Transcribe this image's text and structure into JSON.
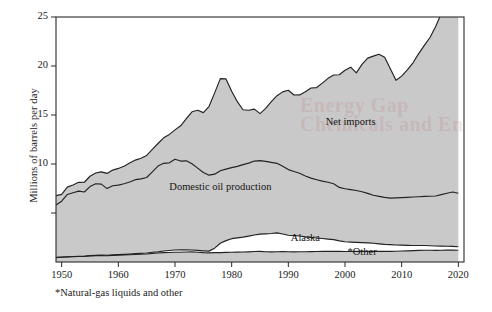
{
  "figure": {
    "footnote": "*Natural-gas liquids and other",
    "watermark_line1": "Energy Gap",
    "watermark_line2": "Chemicals and En"
  },
  "chart_data": {
    "type": "area",
    "stacked": true,
    "title": "",
    "xlabel": "",
    "ylabel": "Millions of barrels per day",
    "xlim": [
      1949,
      2021
    ],
    "ylim": [
      0,
      25
    ],
    "grid": false,
    "legend": "inline-labels",
    "x_ticks": [
      1950,
      1960,
      1970,
      1980,
      1990,
      2000,
      2010,
      2020
    ],
    "x_tick_labels": [
      "1950",
      "1960",
      "1970",
      "1980",
      "1990",
      "2000",
      "2010",
      "2020"
    ],
    "y_ticks": [
      5,
      10,
      15,
      20,
      25
    ],
    "y_tick_labels": [
      "",
      "10",
      "15",
      "20",
      "25"
    ],
    "annotations": [
      {
        "text": "Net imports",
        "x": 2001,
        "y": 14.2
      },
      {
        "text": "Domestic oil production",
        "x": 1978,
        "y": 7.6
      },
      {
        "text": "Alaska",
        "x": 1993,
        "y": 2.35
      },
      {
        "text": "*Other",
        "x": 2003,
        "y": 0.95
      }
    ],
    "x": [
      1949,
      1950,
      1951,
      1952,
      1953,
      1954,
      1955,
      1956,
      1957,
      1958,
      1959,
      1960,
      1961,
      1962,
      1963,
      1964,
      1965,
      1966,
      1967,
      1968,
      1969,
      1970,
      1971,
      1972,
      1973,
      1974,
      1975,
      1976,
      1977,
      1978,
      1979,
      1980,
      1981,
      1982,
      1983,
      1984,
      1985,
      1986,
      1987,
      1988,
      1989,
      1990,
      1991,
      1992,
      1993,
      1994,
      1995,
      1996,
      1997,
      1998,
      1999,
      2000,
      2001,
      2002,
      2003,
      2004,
      2005,
      2006,
      2007,
      2008,
      2009,
      2010,
      2011,
      2012,
      2013,
      2014,
      2015,
      2016,
      2017,
      2018,
      2019,
      2020
    ],
    "series": [
      {
        "name": "*Other",
        "key": "other",
        "fill": "#c9c9c9",
        "values": [
          0.45,
          0.48,
          0.52,
          0.54,
          0.56,
          0.57,
          0.62,
          0.65,
          0.66,
          0.64,
          0.68,
          0.7,
          0.72,
          0.74,
          0.77,
          0.79,
          0.82,
          0.88,
          0.92,
          0.95,
          0.97,
          1.0,
          1.0,
          1.02,
          1.03,
          0.99,
          0.95,
          0.93,
          0.95,
          0.96,
          0.98,
          1.0,
          1.01,
          1.02,
          1.04,
          1.07,
          1.08,
          1.05,
          1.03,
          1.05,
          1.06,
          1.05,
          1.04,
          1.05,
          1.05,
          1.06,
          1.07,
          1.08,
          1.09,
          1.1,
          1.08,
          1.07,
          1.07,
          1.08,
          1.09,
          1.1,
          1.09,
          1.08,
          1.08,
          1.09,
          1.1,
          1.12,
          1.14,
          1.16,
          1.18,
          1.2,
          1.2,
          1.19,
          1.2,
          1.21,
          1.21,
          1.2
        ]
      },
      {
        "name": "Alaska",
        "key": "alaska",
        "fill": "#ffffff",
        "values": [
          0.02,
          0.02,
          0.02,
          0.02,
          0.02,
          0.02,
          0.03,
          0.03,
          0.04,
          0.05,
          0.05,
          0.05,
          0.06,
          0.07,
          0.08,
          0.09,
          0.1,
          0.11,
          0.12,
          0.17,
          0.2,
          0.23,
          0.24,
          0.22,
          0.2,
          0.19,
          0.19,
          0.18,
          0.46,
          0.95,
          1.2,
          1.38,
          1.45,
          1.52,
          1.6,
          1.68,
          1.76,
          1.82,
          1.88,
          1.92,
          1.8,
          1.68,
          1.65,
          1.6,
          1.52,
          1.45,
          1.38,
          1.32,
          1.25,
          1.18,
          1.08,
          1.0,
          0.96,
          0.92,
          0.88,
          0.85,
          0.82,
          0.77,
          0.72,
          0.68,
          0.64,
          0.6,
          0.56,
          0.52,
          0.5,
          0.48,
          0.46,
          0.44,
          0.42,
          0.4,
          0.38,
          0.36
        ]
      },
      {
        "name": "Domestic oil production",
        "key": "lower48",
        "fill": "#c9c9c9",
        "values": [
          5.35,
          5.7,
          6.35,
          6.5,
          6.65,
          6.55,
          7.05,
          7.3,
          7.25,
          6.8,
          7.05,
          7.1,
          7.2,
          7.35,
          7.55,
          7.6,
          7.7,
          8.2,
          8.75,
          8.95,
          8.95,
          9.25,
          9.06,
          9.08,
          8.8,
          8.4,
          8.0,
          7.75,
          7.55,
          7.4,
          7.3,
          7.25,
          7.3,
          7.4,
          7.45,
          7.55,
          7.5,
          7.4,
          7.25,
          7.1,
          6.9,
          6.7,
          6.55,
          6.4,
          6.2,
          6.05,
          5.95,
          5.85,
          5.8,
          5.7,
          5.45,
          5.4,
          5.35,
          5.3,
          5.2,
          5.05,
          4.9,
          4.85,
          4.8,
          4.75,
          4.8,
          4.85,
          4.9,
          4.95,
          4.98,
          5.02,
          5.05,
          5.1,
          5.25,
          5.4,
          5.55,
          5.45
        ]
      },
      {
        "name": "Net imports",
        "key": "net_imports",
        "fill": "#c9c9c9",
        "values": [
          0.95,
          0.7,
          0.75,
          0.8,
          0.9,
          1.0,
          1.05,
          1.1,
          1.25,
          1.55,
          1.6,
          1.7,
          1.8,
          1.95,
          2.0,
          2.1,
          2.25,
          2.3,
          2.3,
          2.6,
          2.9,
          3.0,
          3.6,
          4.3,
          5.3,
          5.9,
          6.1,
          7.0,
          8.3,
          9.4,
          9.2,
          7.8,
          6.6,
          5.6,
          5.4,
          5.3,
          4.8,
          5.4,
          6.2,
          6.9,
          7.6,
          8.1,
          7.8,
          8.0,
          8.6,
          9.2,
          9.4,
          10.0,
          10.6,
          11.1,
          11.5,
          12.1,
          12.5,
          12.0,
          13.0,
          13.8,
          14.2,
          14.5,
          14.3,
          13.2,
          12.0,
          12.4,
          13.0,
          13.7,
          14.6,
          15.4,
          16.2,
          17.3,
          18.5,
          20.0,
          21.8,
          23.3
        ]
      }
    ],
    "total_label": "Total consumption (top of stack)"
  }
}
